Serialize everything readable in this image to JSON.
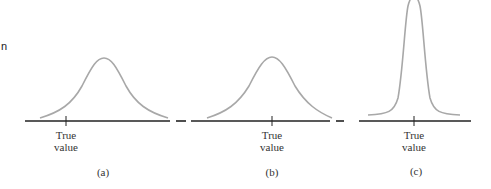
{
  "edge_text": "n",
  "panels": [
    {
      "id": "a",
      "caption": "(a)",
      "tick_label_line1": "True",
      "tick_label_line2": "value",
      "description": "Wide distribution offset to the right of the true value (biased, imprecise)"
    },
    {
      "id": "b",
      "caption": "(b)",
      "tick_label_line1": "True",
      "tick_label_line2": "value",
      "description": "Wide distribution centered on the true value (unbiased, imprecise)"
    },
    {
      "id": "c",
      "caption": "(c)",
      "tick_label_line1": "True",
      "tick_label_line2": "value",
      "description": "Narrow tall distribution centered on the true value (unbiased, precise)"
    }
  ],
  "colors": {
    "axis": "#222222",
    "curve": "#a8a8a8",
    "text": "#333333"
  }
}
